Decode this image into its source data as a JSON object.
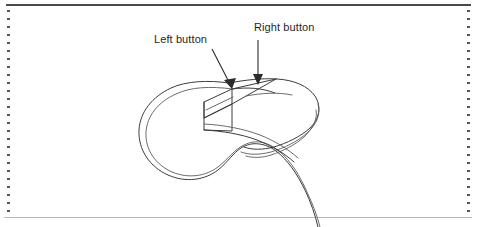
{
  "figure": {
    "view": "three-quarter perspective, cut-away front face",
    "annotations": [
      {
        "id": "left-button",
        "label": "Left button",
        "leader": "diagonal-arrow",
        "arrow_direction": "down-right"
      },
      {
        "id": "right-button",
        "label": "Right button",
        "leader": "vertical-arrow",
        "arrow_direction": "down"
      }
    ],
    "colors": {
      "ink": "#3c3c3c",
      "ink_light": "#5a5a5a",
      "leader": "#2b2b2b",
      "rule_top": "#4a4a4a",
      "rule_bottom": "#b9b9b9",
      "margin_dots": "#555555",
      "paper": "#ffffff"
    },
    "frame": {
      "top_rule": true,
      "bottom_rule": true,
      "left_margin_dots": true,
      "right_margin_dots": true
    }
  }
}
